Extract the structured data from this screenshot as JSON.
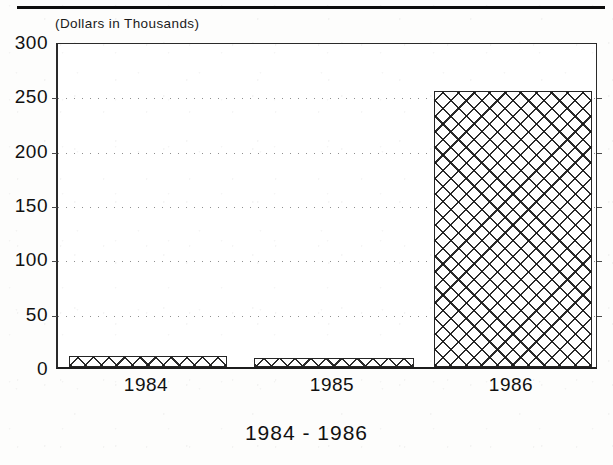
{
  "page": {
    "top_rule": "horizontal-rule",
    "units_label": "(Dollars in Thousands)",
    "caption": "1984 - 1986"
  },
  "chart_data": {
    "type": "bar",
    "title": "",
    "subtitle": "(Dollars in Thousands)",
    "xlabel": "1984 - 1986",
    "ylabel": "",
    "categories": [
      "1984",
      "1985",
      "1986"
    ],
    "values": [
      10,
      8,
      254
    ],
    "ylim": [
      0,
      300
    ],
    "yticks": [
      0,
      50,
      100,
      150,
      200,
      250,
      300
    ],
    "ytick_labels": [
      "0",
      "50",
      "100",
      "150",
      "200",
      "250",
      "300"
    ],
    "xtick_labels": [
      "1984",
      "1985",
      "1986"
    ],
    "grid": true,
    "grid_orientation": "horizontal",
    "grid_style": "dotted",
    "legend": false,
    "legend_position": "none",
    "bar_fill": "diagonal-crosshatch",
    "bar_fill_color": "#191919",
    "bar_edge_color": "#262626",
    "background_color": "#ffffff",
    "axis_color": "#2a2a2a",
    "bars": [
      {
        "category": "1984",
        "value": 10
      },
      {
        "category": "1985",
        "value": 8
      },
      {
        "category": "1986",
        "value": 254
      }
    ]
  }
}
